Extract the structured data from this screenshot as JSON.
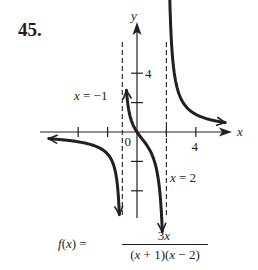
{
  "problem": {
    "number": "45."
  },
  "chart_data": {
    "type": "line",
    "title": "",
    "function": "f(x) = 3x / ((x + 1)(x - 2))",
    "xlabel": "x",
    "ylabel": "y",
    "xlim": [
      -6.2,
      6.5
    ],
    "ylim": [
      -6.3,
      7.5
    ],
    "grid": false,
    "x_ticks": [
      -4,
      -2,
      2,
      4
    ],
    "y_ticks": [
      -4,
      -2,
      2,
      4
    ],
    "tick_labels": {
      "x": [
        "0",
        "4"
      ],
      "y": [
        "4"
      ]
    },
    "vertical_asymptotes": [
      {
        "x": -1,
        "label": "x = −1"
      },
      {
        "x": 2,
        "label": "x = 2"
      }
    ],
    "horizontal_asymptote": 0,
    "series": [
      {
        "name": "left branch",
        "domain": [
          -6,
          -1.2
        ],
        "sample_points": [
          [
            -6,
            -0.64
          ],
          [
            -4,
            -0.67
          ],
          [
            -2,
            -1.5
          ],
          [
            -1.5,
            -2.57
          ],
          [
            -1.2,
            -5.29
          ]
        ]
      },
      {
        "name": "middle branch",
        "domain": [
          -0.72,
          1.72
        ],
        "sample_points": [
          [
            -0.72,
            2.83
          ],
          [
            -0.5,
            1.2
          ],
          [
            0,
            0
          ],
          [
            0.5,
            -0.67
          ],
          [
            1,
            -1.5
          ],
          [
            1.5,
            -3.6
          ],
          [
            1.72,
            -6.3
          ]
        ]
      },
      {
        "name": "right branch",
        "domain": [
          2.2,
          6.0
        ],
        "sample_points": [
          [
            2.2,
            9.4
          ],
          [
            2.5,
            4.29
          ],
          [
            3,
            2.25
          ],
          [
            4,
            1.2
          ],
          [
            6,
            0.64
          ]
        ]
      }
    ]
  },
  "labels": {
    "y_axis": "y",
    "x_axis": "x",
    "origin": "0",
    "x_tick_4": "4",
    "y_tick_4": "4",
    "asym_left": "x = −1",
    "asym_right": "x = 2",
    "formula_lhs": "f(x) =",
    "formula_num": "3x",
    "formula_den": "(x + 1)(x − 2)"
  }
}
